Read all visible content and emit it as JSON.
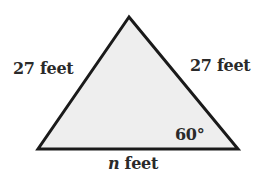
{
  "diagram": {
    "type": "triangle",
    "shape": "isosceles",
    "vertices": {
      "apex": [
        129,
        17
      ],
      "bottom_left": [
        38,
        149
      ],
      "bottom_right": [
        238,
        149
      ]
    },
    "stroke_color": "#1a1a1a",
    "fill_color": "#eeeeee",
    "stroke_width": 3
  },
  "labels": {
    "left_side": "27 feet",
    "right_side": "27 feet",
    "angle": "60°",
    "base_variable": "n",
    "base_unit": " feet"
  }
}
